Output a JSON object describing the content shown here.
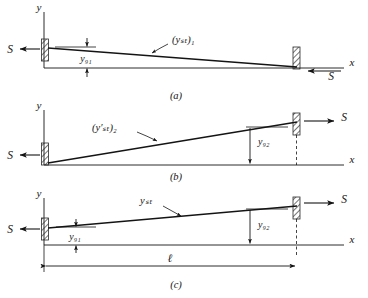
{
  "figure": {
    "name": "three-panel-beam-deflection-diagram",
    "background": "#ffffff",
    "ink": "#141414",
    "width": 368,
    "height": 298
  },
  "axes": {
    "y_label": "y",
    "x_label": "x"
  },
  "panels": [
    {
      "id": "a",
      "caption": "(a)",
      "curve_label": "(yₛₜ)₁",
      "curve_label_plain": "(y_st)_1",
      "left_force_label": "S",
      "left_force_direction": "left",
      "right_force_label": "S",
      "right_force_direction": "left",
      "gap_label": "y₉₁",
      "gap_label_plain": "y_g1",
      "gap_location": "left",
      "slope": "downward",
      "description": "Curve starts above x-axis at left wall and slopes down to meet x-axis at right wall"
    },
    {
      "id": "b",
      "caption": "(b)",
      "curve_label": "(y′ₛₜ)₂",
      "curve_label_plain": "(y'_st)_2",
      "left_force_label": "S",
      "left_force_direction": "left",
      "right_force_label": "S",
      "right_force_direction": "right",
      "gap_label": "y₉₂",
      "gap_label_plain": "y_g2",
      "gap_location": "right",
      "slope": "upward",
      "description": "Curve starts at x-axis at left wall and slopes up to right wall"
    },
    {
      "id": "c",
      "caption": "(c)",
      "curve_label": "yₛₜ",
      "curve_label_plain": "y_st",
      "left_force_label": "S",
      "left_force_direction": "left",
      "right_force_label": "S",
      "right_force_direction": "right",
      "gap_label_left": "y₉₁",
      "gap_label_left_plain": "y_g1",
      "gap_label_right": "y₉₂",
      "gap_label_right_plain": "y_g2",
      "span_label": "ℓ",
      "span_label_plain": "l",
      "slope": "upward",
      "description": "Combined case with both gaps marked and overall span dimension l"
    }
  ],
  "symbols": {
    "wall_support": "hatched-fixed-support",
    "arrow_head": "arrowhead",
    "dimension_line": "double-headed-dimension-arrow"
  }
}
